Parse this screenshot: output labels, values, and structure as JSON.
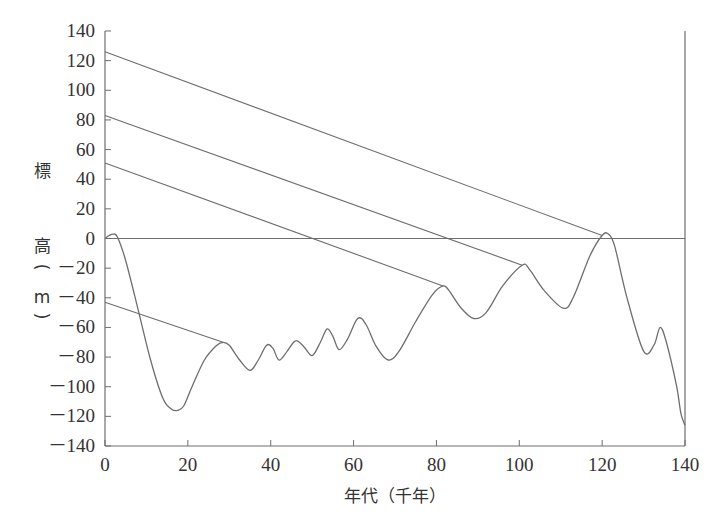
{
  "chart_data": {
    "type": "line",
    "title": "",
    "xlabel": "年代（千年）",
    "ylabel_chars": [
      "標",
      "高",
      "（",
      "m",
      "）"
    ],
    "ylabel": "標高（m）",
    "xlim": [
      0,
      140
    ],
    "ylim": [
      -140,
      140
    ],
    "x_ticks": [
      0,
      20,
      40,
      60,
      80,
      100,
      120,
      140
    ],
    "y_ticks": [
      140,
      120,
      100,
      80,
      60,
      40,
      20,
      0,
      -20,
      -40,
      -60,
      -80,
      -100,
      -120,
      -140
    ],
    "y_tick_labels": [
      "140",
      "120",
      "100",
      "80",
      "60",
      "40",
      "20",
      "0",
      "－20",
      "－40",
      "－60",
      "－80",
      "－100",
      "－120",
      "－140"
    ],
    "grid": false,
    "legend": null,
    "zero_line": true,
    "series": [
      {
        "name": "sea-level curve",
        "x": [
          0,
          1,
          2,
          3,
          5,
          8,
          11,
          14,
          16,
          17.5,
          19,
          21,
          24,
          27,
          28.5,
          30,
          32.5,
          35,
          37,
          39,
          40.5,
          42,
          44,
          46,
          48,
          50,
          52,
          53.6,
          55,
          56.5,
          58.5,
          61,
          63,
          65.5,
          68.3,
          71,
          75,
          79,
          81.6,
          83,
          86,
          89,
          92,
          96,
          100.7,
          102.5,
          106,
          110.6,
          113,
          117,
          120,
          121.5,
          123,
          126,
          130,
          132.5,
          134,
          135.5,
          138,
          139,
          140
        ],
        "y": [
          0,
          2,
          3,
          1,
          -15,
          -48,
          -82,
          -108,
          -115,
          -116,
          -113,
          -100,
          -82,
          -72,
          -70,
          -72,
          -82,
          -89,
          -82,
          -72,
          -74,
          -82,
          -76,
          -69,
          -73,
          -79,
          -70,
          -61,
          -66,
          -75,
          -68,
          -54,
          -58,
          -73,
          -82,
          -76,
          -56,
          -38,
          -32,
          -35,
          -47,
          -54,
          -50,
          -32,
          -18,
          -21,
          -35,
          -47,
          -40,
          -12,
          2,
          3,
          -5,
          -40,
          -76,
          -72,
          -60,
          -70,
          -100,
          -118,
          -126
        ]
      }
    ],
    "terrace_lines": [
      {
        "from": {
          "x": 0,
          "y": 126
        },
        "to": {
          "x": 120,
          "y": 2
        }
      },
      {
        "from": {
          "x": 0,
          "y": 83
        },
        "to": {
          "x": 100.7,
          "y": -18
        }
      },
      {
        "from": {
          "x": 0,
          "y": 51
        },
        "to": {
          "x": 81.6,
          "y": -32
        }
      },
      {
        "from": {
          "x": 0,
          "y": -43
        },
        "to": {
          "x": 28.5,
          "y": -70
        }
      }
    ]
  },
  "colors": {
    "line": "#6e6e6e",
    "axis": "#6e6e6e",
    "text": "#333333"
  }
}
